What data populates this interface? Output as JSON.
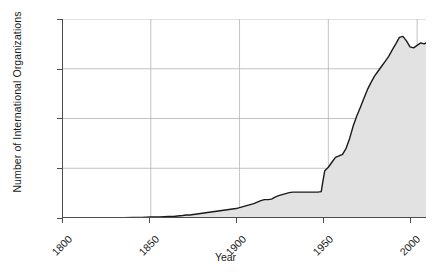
{
  "chart_data": {
    "type": "area",
    "title": "",
    "xlabel": "Year",
    "ylabel": "Number of International Organizations",
    "xlim": [
      1800,
      2005
    ],
    "ylim": [
      0,
      400
    ],
    "xticks": [
      1800,
      1850,
      1900,
      1950,
      2000
    ],
    "yticks": [
      0,
      100,
      200,
      300,
      400
    ],
    "xtick_labels": [
      "1800",
      "1850",
      "1900",
      "1950",
      "2000"
    ],
    "ytick_labels": [
      "0",
      "100",
      "200",
      "300",
      "400"
    ],
    "grid": true,
    "legend": "none",
    "fill_color": "#e2e2e2",
    "line_color": "#1a1a1a",
    "grid_color": "#b4b4b4",
    "axis_color": "#4d4d4d",
    "background_color": "#ffffff",
    "series": [
      {
        "name": "Number of International Organizations",
        "x": [
          1800,
          1810,
          1820,
          1830,
          1840,
          1845,
          1850,
          1855,
          1860,
          1863,
          1865,
          1868,
          1870,
          1872,
          1874,
          1876,
          1878,
          1880,
          1882,
          1884,
          1886,
          1888,
          1890,
          1892,
          1894,
          1896,
          1898,
          1900,
          1902,
          1904,
          1906,
          1908,
          1910,
          1912,
          1914,
          1916,
          1918,
          1920,
          1922,
          1924,
          1926,
          1928,
          1930,
          1932,
          1934,
          1936,
          1938,
          1940,
          1942,
          1944,
          1946,
          1947,
          1948,
          1950,
          1952,
          1954,
          1956,
          1958,
          1960,
          1962,
          1964,
          1966,
          1968,
          1970,
          1972,
          1974,
          1976,
          1978,
          1980,
          1982,
          1984,
          1986,
          1988,
          1990,
          1992,
          1994,
          1996,
          1998,
          2000,
          2002,
          2004,
          2005
        ],
        "y": [
          0,
          0,
          0,
          0,
          1,
          1,
          2,
          2,
          3,
          3,
          4,
          5,
          6,
          6,
          7,
          8,
          9,
          10,
          11,
          12,
          13,
          14,
          15,
          16,
          17,
          18,
          19,
          21,
          23,
          25,
          27,
          29,
          32,
          35,
          37,
          37,
          38,
          42,
          45,
          47,
          49,
          51,
          52,
          52,
          52,
          52,
          52,
          52,
          52,
          52,
          53,
          75,
          95,
          102,
          112,
          122,
          125,
          128,
          140,
          160,
          185,
          205,
          222,
          240,
          258,
          272,
          285,
          295,
          305,
          315,
          325,
          338,
          350,
          363,
          365,
          356,
          344,
          342,
          347,
          352,
          350,
          352
        ]
      }
    ]
  }
}
